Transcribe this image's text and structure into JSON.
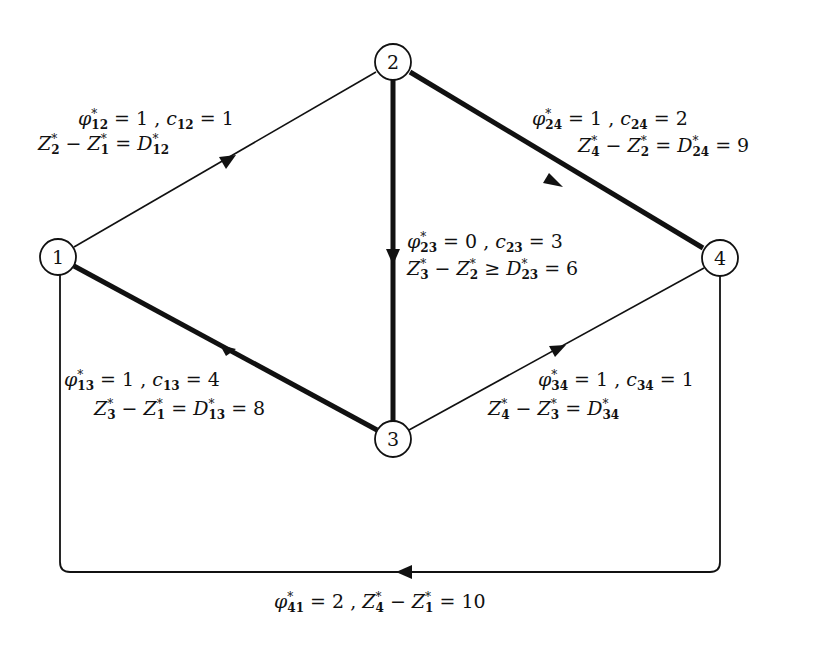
{
  "diagram": {
    "type": "network-flow-graph",
    "nodes": [
      {
        "id": "1",
        "label": "1",
        "x": 58,
        "y": 257
      },
      {
        "id": "2",
        "label": "2",
        "x": 393,
        "y": 62
      },
      {
        "id": "3",
        "label": "3",
        "x": 393,
        "y": 439
      },
      {
        "id": "4",
        "label": "4",
        "x": 720,
        "y": 258
      }
    ],
    "edges": [
      {
        "from": "1",
        "to": "2",
        "bold": false,
        "phi": "1",
        "c": "1",
        "relation": "=",
        "D_value": ""
      },
      {
        "from": "2",
        "to": "4",
        "bold": true,
        "phi": "1",
        "c": "2",
        "relation": "=",
        "D_value": "9"
      },
      {
        "from": "2",
        "to": "3",
        "bold": true,
        "phi": "0",
        "c": "3",
        "relation": "≥",
        "D_value": "6"
      },
      {
        "from": "1",
        "to": "3",
        "bold": true,
        "phi": "1",
        "c": "4",
        "relation": "=",
        "D_value": "8"
      },
      {
        "from": "3",
        "to": "4",
        "bold": false,
        "phi": "1",
        "c": "1",
        "relation": "=",
        "D_value": ""
      },
      {
        "from": "4",
        "to": "1",
        "bold": false,
        "phi": "2",
        "return_value": "10"
      }
    ]
  },
  "labels": {
    "e12": {
      "line1": "φ*12 = 1 , c12 = 1",
      "line2": "Z*2 − Z*1 = D*12"
    },
    "e24": {
      "line1": "φ*24 = 1 , c24 = 2",
      "line2": "Z*4 − Z*2 = D*24 = 9"
    },
    "e23": {
      "line1": "φ*23 = 0 , c23 = 3",
      "line2": "Z*3 − Z*2 ≥ D*23 = 6"
    },
    "e13": {
      "line1": "φ*13 = 1 , c13 = 4",
      "line2": "Z*3 − Z*1 = D*13 = 8"
    },
    "e34": {
      "line1": "φ*34 = 1 , c34 = 1",
      "line2": "Z*4 − Z*3 = D*34"
    },
    "e41": {
      "line1": "φ*41 = 2 , Z*4 − Z*1 = 10"
    }
  },
  "parts": {
    "phi": "φ",
    "c": "c",
    "Z": "Z",
    "D": "D",
    "star": "*",
    "eq": "=",
    "geq": "≥",
    "minus": "−",
    "comma": ",",
    "e12": {
      "phi_sub": "12",
      "phi_val": "1",
      "c_sub": "12",
      "c_val": "1",
      "za": "2",
      "zb": "1",
      "d_sub": "12"
    },
    "e24": {
      "phi_sub": "24",
      "phi_val": "1",
      "c_sub": "24",
      "c_val": "2",
      "za": "4",
      "zb": "2",
      "d_sub": "24",
      "d_val": "9"
    },
    "e23": {
      "phi_sub": "23",
      "phi_val": "0",
      "c_sub": "23",
      "c_val": "3",
      "za": "3",
      "zb": "2",
      "d_sub": "23",
      "d_val": "6"
    },
    "e13": {
      "phi_sub": "13",
      "phi_val": "1",
      "c_sub": "13",
      "c_val": "4",
      "za": "3",
      "zb": "1",
      "d_sub": "13",
      "d_val": "8"
    },
    "e34": {
      "phi_sub": "34",
      "phi_val": "1",
      "c_sub": "34",
      "c_val": "1",
      "za": "4",
      "zb": "3",
      "d_sub": "34"
    },
    "e41": {
      "phi_sub": "41",
      "phi_val": "2",
      "za": "4",
      "zb": "1",
      "val": "10"
    }
  },
  "colors": {
    "stroke": "#111111",
    "background": "#ffffff"
  }
}
